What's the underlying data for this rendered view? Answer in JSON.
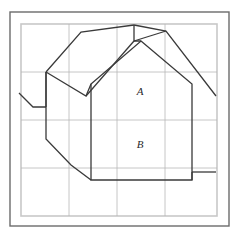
{
  "figure": {
    "canvas": {
      "width": 239,
      "height": 238,
      "background": "#ffffff"
    },
    "outer_border": {
      "name": "outer-frame",
      "x": 10,
      "y": 12,
      "width": 219,
      "height": 214,
      "color": "#6b6b6b",
      "stroke_width": 1.4
    },
    "inner_border": {
      "name": "inner-frame",
      "x": 21,
      "y": 24,
      "width": 196,
      "height": 192,
      "color": "#c8c8c8",
      "stroke_width": 1.6
    },
    "grid": {
      "color": "#b8b8b8",
      "stroke_width": 0.8,
      "visible": true,
      "vertical_x": [
        69,
        117,
        165
      ],
      "horizontal_y": [
        72,
        120,
        168
      ]
    },
    "shapes": [
      {
        "name": "upright-house-outline",
        "stroke": "#3a3a3a",
        "stroke_width": 1.3,
        "fill": "none",
        "points": "141,41 192,84 192,180 91,180 91,84"
      },
      {
        "name": "tilted-house-outline",
        "stroke": "#3a3a3a",
        "stroke_width": 1.3,
        "fill": "none",
        "points": "46,72 81,32 134,25 134,41 141,41 192,84 216,96 192,180 91,180 91,84 46,107"
      },
      {
        "name": "tilted-house-left-wall",
        "stroke": "#3a3a3a",
        "stroke_width": 1.3,
        "path": "M 46,72 L 46,139 L 71,165 L 91,180"
      },
      {
        "name": "tilted-house-ridge",
        "stroke": "#3a3a3a",
        "stroke_width": 1.3,
        "path": "M 46,72 L 86,96 L 91,84"
      },
      {
        "name": "tilted-house-right-eave",
        "stroke": "#3a3a3a",
        "stroke_width": 1.3,
        "path": "M 134,25 L 166,31 L 216,96"
      },
      {
        "name": "tilted-house-peak-fold",
        "stroke": "#3a3a3a",
        "stroke_width": 1.3,
        "path": "M 134,41 L 166,31"
      },
      {
        "name": "left-step-tail",
        "stroke": "#3a3a3a",
        "stroke_width": 1.3,
        "path": "M 19,93 L 33,107 L 46,107"
      },
      {
        "name": "right-step-tail",
        "stroke": "#3a3a3a",
        "stroke_width": 1.3,
        "path": "M 192,180 L 192,172 L 216,172"
      }
    ],
    "labels": [
      {
        "name": "region-label-a",
        "text": "A",
        "x": 140,
        "y": 95
      },
      {
        "name": "region-label-b",
        "text": "B",
        "x": 140,
        "y": 148
      }
    ]
  }
}
